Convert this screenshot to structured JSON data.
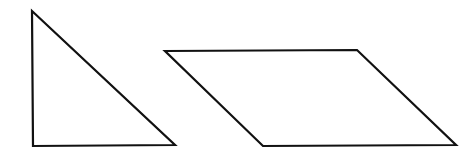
{
  "canvas": {
    "width": 476,
    "height": 158,
    "background": "#ffffff"
  },
  "style": {
    "stroke": "#111111",
    "stroke_width": 2.2
  },
  "shapes": [
    {
      "name": "right-triangle",
      "points": "32,11 33,146 175,145"
    },
    {
      "name": "parallelogram",
      "points": "165,51 357,50 456,145 263,146"
    }
  ]
}
